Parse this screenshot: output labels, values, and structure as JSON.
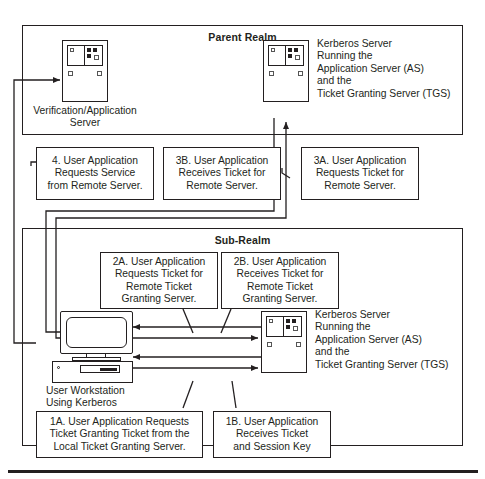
{
  "diagram": {
    "bottom_rule": true
  },
  "realms": {
    "parent": {
      "title": "Parent Realm"
    },
    "sub": {
      "title": "Sub-Realm"
    }
  },
  "devices": {
    "verification_server": {
      "icon": "server-icon",
      "label": "Verification/Application\nServer"
    },
    "parent_kerberos_server": {
      "icon": "server-icon",
      "label": "Kerberos Server\nRunning the\nApplication Server (AS)\nand the\nTicket Granting Server (TGS)"
    },
    "user_workstation": {
      "icon": "workstation-icon",
      "label": "User Workstation\nUsing Kerberos"
    },
    "sub_kerberos_server": {
      "icon": "server-icon",
      "label": "Kerberos Server\nRunning the\nApplication Server (AS)\nand the\nTicket Granting Server (TGS)"
    }
  },
  "callouts": {
    "step4": "4. User Application\nRequests Service\nfrom Remote Server.",
    "step3b": "3B. User Application\nReceives Ticket for\nRemote Server.",
    "step3a": "3A. User Application\nRequests Ticket for\nRemote Server.",
    "step2a": "2A. User Application\nRequests Ticket for\nRemote Ticket\nGranting Server.",
    "step2b": "2B. User Application\nReceives Ticket for\nRemote Ticket\nGranting Server.",
    "step1a": "1A. User Application Requests\nTicket Granting Ticket from the\nLocal Ticket Granting Server.",
    "step1b": "1B. User Application\nReceives Ticket\nand Session Key"
  },
  "colors": {
    "ink": "#231f20",
    "background": "#ffffff"
  }
}
